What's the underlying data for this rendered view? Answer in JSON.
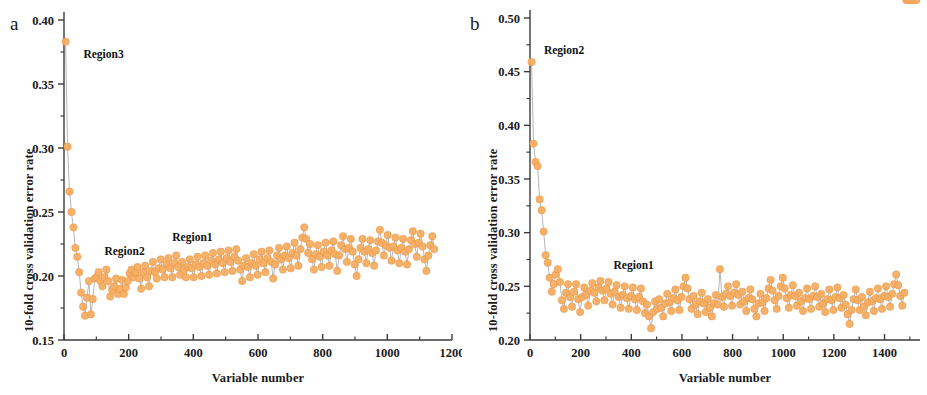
{
  "figure": {
    "background": "#ffffff",
    "width": 927,
    "height": 395,
    "marker_color": "#f6ae62",
    "marker_edge_color": "#e8913c",
    "line_color": "#8d93a1",
    "axis_color": "#3b3b3b"
  },
  "panels": [
    {
      "letter": "a",
      "chart_data": {
        "type": "scatter",
        "title": "",
        "subtitle": "",
        "xlabel": "Variable number",
        "ylabel": "10-fold cross validation error rate",
        "xlim": [
          0,
          1200
        ],
        "ylim": [
          0.15,
          0.4
        ],
        "xticks": [
          0,
          200,
          400,
          600,
          800,
          1000,
          1200
        ],
        "xticklabels": [
          "0",
          "200",
          "400",
          "600",
          "800",
          "1000",
          "1200"
        ],
        "yticks": [
          0.15,
          0.2,
          0.25,
          0.3,
          0.35,
          0.4
        ],
        "yticklabels": [
          "0.15",
          "0.20",
          "0.25",
          "0.30",
          "0.35",
          "0.40"
        ],
        "x_minor_step": 100,
        "y_minor_step": 0.025,
        "grid": false,
        "legend": "none",
        "marker_size": 5.0,
        "connect_points": true,
        "annotations": [
          {
            "text": "Region3",
            "x": 60,
            "y": 0.372
          },
          {
            "text": "Region2",
            "x": 125,
            "y": 0.218
          },
          {
            "text": "Region1",
            "x": 335,
            "y": 0.229
          }
        ],
        "series": [
          {
            "name": "10-fold CV error rate",
            "x": [
              5,
              11,
              17,
              23,
              29,
              35,
              41,
              47,
              53,
              59,
              65,
              71,
              77,
              83,
              89,
              95,
              101,
              107,
              113,
              119,
              125,
              131,
              137,
              143,
              149,
              155,
              161,
              167,
              173,
              179,
              185,
              191,
              197,
              203,
              209,
              215,
              221,
              227,
              233,
              239,
              245,
              251,
              257,
              263,
              269,
              275,
              281,
              287,
              293,
              299,
              305,
              311,
              317,
              323,
              329,
              335,
              341,
              347,
              353,
              359,
              365,
              371,
              377,
              383,
              389,
              395,
              401,
              407,
              413,
              419,
              425,
              431,
              437,
              443,
              449,
              455,
              461,
              467,
              473,
              479,
              485,
              491,
              497,
              503,
              509,
              515,
              521,
              527,
              533,
              539,
              545,
              551,
              557,
              563,
              569,
              575,
              581,
              587,
              593,
              599,
              605,
              611,
              617,
              623,
              629,
              635,
              641,
              647,
              653,
              659,
              665,
              671,
              677,
              683,
              689,
              695,
              701,
              707,
              713,
              719,
              725,
              731,
              737,
              743,
              749,
              755,
              761,
              767,
              773,
              779,
              785,
              791,
              797,
              803,
              809,
              815,
              821,
              827,
              833,
              839,
              845,
              851,
              857,
              863,
              869,
              875,
              881,
              887,
              893,
              899,
              905,
              911,
              917,
              923,
              929,
              935,
              941,
              947,
              953,
              959,
              965,
              971,
              977,
              983,
              989,
              995,
              1001,
              1007,
              1013,
              1019,
              1025,
              1031,
              1037,
              1043,
              1049,
              1055,
              1061,
              1067,
              1073,
              1079,
              1085,
              1091,
              1097,
              1103,
              1109,
              1115,
              1121,
              1127,
              1133,
              1139,
              1145
            ],
            "y": [
              0.383,
              0.301,
              0.266,
              0.25,
              0.238,
              0.222,
              0.215,
              0.203,
              0.187,
              0.176,
              0.169,
              0.183,
              0.196,
              0.17,
              0.182,
              0.198,
              0.199,
              0.203,
              0.196,
              0.192,
              0.199,
              0.205,
              0.196,
              0.184,
              0.189,
              0.192,
              0.198,
              0.186,
              0.19,
              0.197,
              0.186,
              0.191,
              0.196,
              0.202,
              0.205,
              0.199,
              0.203,
              0.207,
              0.198,
              0.19,
              0.203,
              0.208,
              0.199,
              0.192,
              0.204,
              0.211,
              0.203,
              0.198,
              0.206,
              0.213,
              0.205,
              0.199,
              0.209,
              0.214,
              0.206,
              0.199,
              0.21,
              0.216,
              0.207,
              0.201,
              0.211,
              0.205,
              0.199,
              0.207,
              0.213,
              0.206,
              0.199,
              0.209,
              0.215,
              0.207,
              0.2,
              0.21,
              0.216,
              0.208,
              0.201,
              0.212,
              0.218,
              0.209,
              0.202,
              0.213,
              0.219,
              0.21,
              0.203,
              0.214,
              0.22,
              0.211,
              0.204,
              0.215,
              0.221,
              0.212,
              0.205,
              0.196,
              0.208,
              0.214,
              0.207,
              0.199,
              0.21,
              0.217,
              0.208,
              0.201,
              0.213,
              0.219,
              0.21,
              0.203,
              0.214,
              0.22,
              0.211,
              0.198,
              0.209,
              0.216,
              0.222,
              0.213,
              0.205,
              0.216,
              0.223,
              0.214,
              0.206,
              0.218,
              0.226,
              0.216,
              0.208,
              0.221,
              0.23,
              0.238,
              0.229,
              0.218,
              0.225,
              0.213,
              0.205,
              0.217,
              0.224,
              0.215,
              0.207,
              0.219,
              0.226,
              0.216,
              0.208,
              0.22,
              0.227,
              0.217,
              0.204,
              0.216,
              0.224,
              0.231,
              0.221,
              0.211,
              0.222,
              0.229,
              0.219,
              0.209,
              0.2,
              0.213,
              0.222,
              0.229,
              0.219,
              0.21,
              0.221,
              0.228,
              0.218,
              0.208,
              0.22,
              0.227,
              0.236,
              0.226,
              0.216,
              0.224,
              0.232,
              0.222,
              0.212,
              0.223,
              0.23,
              0.22,
              0.21,
              0.222,
              0.229,
              0.219,
              0.209,
              0.221,
              0.228,
              0.235,
              0.225,
              0.215,
              0.226,
              0.233,
              0.223,
              0.213,
              0.204,
              0.216,
              0.224,
              0.231,
              0.221,
              0.211,
              0.218
            ]
          }
        ]
      }
    },
    {
      "letter": "b",
      "chart_data": {
        "type": "scatter",
        "title": "",
        "subtitle": "",
        "xlabel": "Variable number",
        "ylabel": "10-fold cross validation error rate",
        "xlim": [
          0,
          1540
        ],
        "ylim": [
          0.2,
          0.5
        ],
        "xticks": [
          0,
          200,
          400,
          600,
          800,
          1000,
          1200,
          1400
        ],
        "xticklabels": [
          "0",
          "200",
          "400",
          "600",
          "800",
          "1000",
          "1200",
          "1400"
        ],
        "yticks": [
          0.2,
          0.25,
          0.3,
          0.35,
          0.4,
          0.45,
          0.5
        ],
        "yticklabels": [
          "0.20",
          "0.25",
          "0.30",
          "0.35",
          "0.40",
          "0.45",
          "0.50"
        ],
        "x_minor_step": 100,
        "y_minor_step": 0.025,
        "grid": false,
        "legend": "none",
        "marker_size": 5.0,
        "connect_points": true,
        "annotations": [
          {
            "text": "Region2",
            "x": 55,
            "y": 0.468
          },
          {
            "text": "Region1",
            "x": 330,
            "y": 0.268
          }
        ],
        "series": [
          {
            "name": "10-fold CV error rate",
            "x": [
              6,
              14,
              22,
              30,
              38,
              46,
              54,
              62,
              70,
              78,
              86,
              94,
              102,
              110,
              118,
              126,
              134,
              142,
              150,
              158,
              166,
              174,
              182,
              190,
              198,
              206,
              214,
              222,
              230,
              238,
              246,
              254,
              262,
              270,
              278,
              286,
              294,
              302,
              310,
              318,
              326,
              334,
              342,
              350,
              358,
              366,
              374,
              382,
              390,
              398,
              406,
              414,
              422,
              430,
              438,
              446,
              454,
              462,
              470,
              478,
              486,
              494,
              502,
              510,
              518,
              526,
              534,
              542,
              550,
              558,
              566,
              574,
              582,
              590,
              598,
              606,
              614,
              622,
              630,
              638,
              646,
              654,
              662,
              670,
              678,
              686,
              694,
              702,
              710,
              718,
              726,
              734,
              742,
              750,
              758,
              766,
              774,
              782,
              790,
              798,
              806,
              814,
              822,
              830,
              838,
              846,
              854,
              862,
              870,
              878,
              886,
              894,
              902,
              910,
              918,
              926,
              934,
              942,
              950,
              958,
              966,
              974,
              982,
              990,
              998,
              1006,
              1014,
              1022,
              1030,
              1038,
              1046,
              1054,
              1062,
              1070,
              1078,
              1086,
              1094,
              1102,
              1110,
              1118,
              1126,
              1134,
              1142,
              1150,
              1158,
              1166,
              1174,
              1182,
              1190,
              1198,
              1206,
              1214,
              1222,
              1230,
              1238,
              1246,
              1254,
              1262,
              1270,
              1278,
              1286,
              1294,
              1302,
              1310,
              1318,
              1326,
              1334,
              1342,
              1350,
              1358,
              1366,
              1374,
              1382,
              1390,
              1398,
              1406,
              1414,
              1422,
              1430,
              1438,
              1446,
              1454,
              1462,
              1470,
              1478,
              1486,
              1494,
              1502,
              1510,
              1518,
              1526
            ],
            "y": [
              0.459,
              0.383,
              0.366,
              0.362,
              0.331,
              0.321,
              0.301,
              0.279,
              0.272,
              0.258,
              0.245,
              0.252,
              0.261,
              0.266,
              0.254,
              0.237,
              0.229,
              0.244,
              0.252,
              0.24,
              0.231,
              0.245,
              0.252,
              0.238,
              0.226,
              0.24,
              0.249,
              0.242,
              0.232,
              0.246,
              0.253,
              0.244,
              0.236,
              0.249,
              0.255,
              0.246,
              0.237,
              0.248,
              0.254,
              0.243,
              0.233,
              0.245,
              0.251,
              0.24,
              0.23,
              0.242,
              0.25,
              0.239,
              0.229,
              0.241,
              0.249,
              0.238,
              0.228,
              0.24,
              0.248,
              0.236,
              0.225,
              0.233,
              0.222,
              0.211,
              0.226,
              0.236,
              0.229,
              0.238,
              0.23,
              0.222,
              0.234,
              0.243,
              0.235,
              0.227,
              0.239,
              0.247,
              0.237,
              0.228,
              0.24,
              0.25,
              0.258,
              0.248,
              0.238,
              0.229,
              0.241,
              0.233,
              0.224,
              0.236,
              0.244,
              0.234,
              0.226,
              0.238,
              0.23,
              0.222,
              0.234,
              0.242,
              0.233,
              0.266,
              0.24,
              0.231,
              0.243,
              0.25,
              0.241,
              0.232,
              0.244,
              0.252,
              0.242,
              0.233,
              0.245,
              0.236,
              0.227,
              0.239,
              0.247,
              0.238,
              0.229,
              0.222,
              0.234,
              0.243,
              0.235,
              0.227,
              0.239,
              0.248,
              0.256,
              0.246,
              0.237,
              0.229,
              0.241,
              0.25,
              0.258,
              0.248,
              0.239,
              0.23,
              0.242,
              0.251,
              0.241,
              0.232,
              0.244,
              0.236,
              0.227,
              0.239,
              0.248,
              0.238,
              0.229,
              0.241,
              0.25,
              0.24,
              0.231,
              0.243,
              0.234,
              0.226,
              0.238,
              0.247,
              0.237,
              0.228,
              0.24,
              0.249,
              0.239,
              0.23,
              0.242,
              0.233,
              0.224,
              0.215,
              0.228,
              0.238,
              0.247,
              0.237,
              0.228,
              0.24,
              0.231,
              0.223,
              0.235,
              0.245,
              0.236,
              0.227,
              0.239,
              0.248,
              0.238,
              0.229,
              0.241,
              0.25,
              0.24,
              0.231,
              0.243,
              0.252,
              0.261,
              0.251,
              0.241,
              0.232,
              0.244
            ]
          }
        ]
      }
    }
  ]
}
